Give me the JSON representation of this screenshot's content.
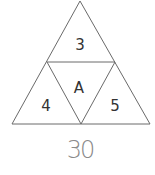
{
  "puzzle": {
    "cells": {
      "top": "3",
      "left": "4",
      "center": "A",
      "right": "5"
    },
    "answer": "30"
  },
  "colors": {
    "line": "#6a6a6a",
    "label": "#333333",
    "answer": "#8a8a8a"
  }
}
